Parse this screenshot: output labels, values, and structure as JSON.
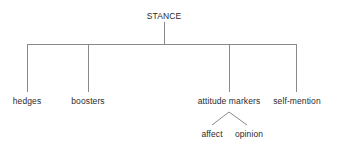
{
  "diagram": {
    "title": "STANCE",
    "type": "tree",
    "colors": {
      "background": "#ffffff",
      "line": "#8a8a8a",
      "text": "#2b2b2b"
    },
    "root": {
      "label": "STANCE",
      "x": 164,
      "y": 16
    },
    "children": [
      {
        "label": "hedges",
        "x": 27,
        "y": 101
      },
      {
        "label": "boosters",
        "x": 88,
        "y": 101
      },
      {
        "label": "attitude markers",
        "x": 229,
        "y": 101
      },
      {
        "label": "self-mention",
        "x": 297,
        "y": 101
      }
    ],
    "grandchildren": [
      {
        "label": "affect",
        "x": 212,
        "y": 134,
        "parent": "attitude markers"
      },
      {
        "label": "opinion",
        "x": 249,
        "y": 134,
        "parent": "attitude markers"
      }
    ],
    "edges": {
      "root_stem": {
        "x": 164,
        "y1": 22,
        "y2": 44
      },
      "crossbar": {
        "y": 44,
        "x1": 27,
        "x2": 297
      },
      "drops": [
        {
          "x": 27,
          "y1": 44,
          "y2": 92
        },
        {
          "x": 88,
          "y1": 44,
          "y2": 92
        },
        {
          "x": 229,
          "y1": 44,
          "y2": 92
        },
        {
          "x": 297,
          "y1": 44,
          "y2": 92
        }
      ],
      "sub_branch": {
        "apex_x": 229,
        "apex_y": 112,
        "left_x": 212,
        "left_y": 125,
        "right_x": 247,
        "right_y": 125
      }
    }
  }
}
